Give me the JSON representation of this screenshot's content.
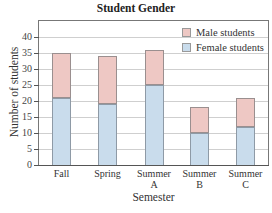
{
  "chart_data": {
    "type": "bar",
    "stacked": true,
    "title": "Student Gender",
    "xlabel": "Semester",
    "ylabel": "Number of students",
    "ylim": [
      0,
      40
    ],
    "yticks": [
      0,
      5,
      10,
      15,
      20,
      25,
      30,
      35,
      40
    ],
    "grid": true,
    "legend_position": "top-right",
    "categories": [
      "Fall",
      "Spring",
      "Summer A",
      "Summer B",
      "Summer C"
    ],
    "category_labels": [
      [
        "Fall"
      ],
      [
        "Spring"
      ],
      [
        "Summer",
        "A"
      ],
      [
        "Summer",
        "B"
      ],
      [
        "Summer",
        "C"
      ]
    ],
    "series": [
      {
        "name": "Female students",
        "color": "#c9dcec",
        "values": [
          21,
          19,
          25,
          10,
          12
        ]
      },
      {
        "name": "Male students",
        "color": "#eec8c4",
        "values": [
          14,
          15,
          11,
          8,
          9
        ]
      }
    ],
    "totals": [
      35,
      34,
      36,
      18,
      21
    ]
  },
  "legend": {
    "male": "Male students",
    "female": "Female students"
  }
}
